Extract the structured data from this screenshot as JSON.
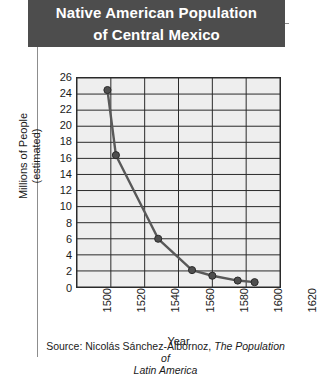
{
  "title": {
    "line1": "Native American Population",
    "line2": "of Central Mexico"
  },
  "colors": {
    "title_banner_bg": "#4d4d4d",
    "title_text": "#ffffff",
    "plot_bg": "#eeeeee",
    "gridline": "#2a2a2a",
    "series_line": "#595959",
    "marker_fill": "#4f4f4f",
    "frame_rule": "#8d8d8d"
  },
  "y_axis": {
    "title_line1": "Millions of People",
    "title_line2": "(estimated)",
    "ticks": [
      "0",
      "2",
      "4",
      "6",
      "8",
      "10",
      "12",
      "14",
      "16",
      "18",
      "20",
      "22",
      "24",
      "26"
    ]
  },
  "x_axis": {
    "title": "Year",
    "ticks": [
      "1500",
      "1520",
      "1540",
      "1560",
      "1580",
      "1600",
      "1620"
    ]
  },
  "source": {
    "prefix": "Source: Nicolás Sánchez-Albornoz, ",
    "work_line1": "The Population of",
    "work_line2": "Latin America"
  },
  "chart_data": {
    "type": "line",
    "title": "Native American Population of Central Mexico",
    "xlabel": "Year",
    "ylabel": "Millions of People (estimated)",
    "xlim": [
      1500,
      1620
    ],
    "ylim": [
      0,
      26
    ],
    "xticks": [
      1500,
      1520,
      1540,
      1560,
      1580,
      1600,
      1620
    ],
    "yticks": [
      0,
      2,
      4,
      6,
      8,
      10,
      12,
      14,
      16,
      18,
      20,
      22,
      24,
      26
    ],
    "grid": true,
    "legend": "none",
    "series": [
      {
        "name": "Native American population of Central Mexico",
        "x": [
          1518,
          1523,
          1548,
          1568,
          1580,
          1595,
          1605
        ],
        "y": [
          24.5,
          16.4,
          6.0,
          2.1,
          1.4,
          0.8,
          0.6
        ]
      }
    ]
  }
}
